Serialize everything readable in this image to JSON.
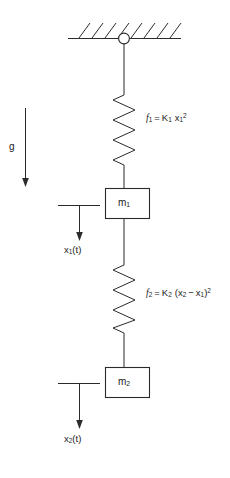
{
  "figure": {
    "background_color": "#ffffff",
    "stroke_color": "#2b2b2b"
  },
  "support": {
    "name": "ceiling",
    "hatch_count": 8,
    "pivot_label": "pivot-joint"
  },
  "gravity": {
    "label": "g",
    "direction": "down"
  },
  "springs": [
    {
      "id": "spring-1",
      "label_plain": "f1 = K1 x1^2",
      "f_symbol": "f",
      "f_sub": "1",
      "equals": "=",
      "k_symbol": "K",
      "k_sub": "1",
      "x_symbol": "x",
      "x_sub": "1",
      "exponent": "2"
    },
    {
      "id": "spring-2",
      "label_plain": "f2 = K2 (x2 - x1)^2",
      "f_symbol": "f",
      "f_sub": "2",
      "equals": "=",
      "k_symbol": "K",
      "k_sub": "2",
      "open_paren": "(",
      "x_symbol": "x",
      "x_sub": "2",
      "minus": "−",
      "x2_symbol": "x",
      "x2_sub": "1",
      "close_paren": ")",
      "exponent": "2"
    }
  ],
  "masses": [
    {
      "id": "mass-1",
      "symbol": "m",
      "sub": "1",
      "label_plain": "m1"
    },
    {
      "id": "mass-2",
      "symbol": "m",
      "sub": "2",
      "label_plain": "m2"
    }
  ],
  "displacements": [
    {
      "id": "x1t",
      "symbol": "x",
      "sub": "1",
      "arg": "(t)",
      "label_plain": "x1(t)",
      "direction": "down"
    },
    {
      "id": "x2t",
      "symbol": "x",
      "sub": "2",
      "arg": "(t)",
      "label_plain": "x2(t)",
      "direction": "down"
    }
  ]
}
